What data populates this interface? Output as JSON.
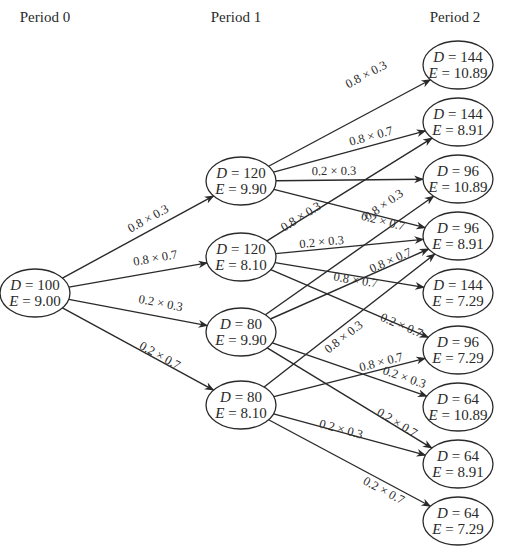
{
  "periods": [
    {
      "label": "Period 0",
      "x": 45,
      "y": 22
    },
    {
      "label": "Period 1",
      "x": 236,
      "y": 22
    },
    {
      "label": "Period 2",
      "x": 455,
      "y": 22
    }
  ],
  "node_style": {
    "rx": 35,
    "ry": 24,
    "stroke": "#2a2a2a"
  },
  "nodes": [
    {
      "id": "p0",
      "period": 0,
      "D": "100",
      "E": "9.00",
      "x": 35,
      "y": 293
    },
    {
      "id": "p1a",
      "period": 1,
      "D": "120",
      "E": "9.90",
      "x": 241,
      "y": 181
    },
    {
      "id": "p1b",
      "period": 1,
      "D": "120",
      "E": "8.10",
      "x": 241,
      "y": 257
    },
    {
      "id": "p1c",
      "period": 1,
      "D": "80",
      "E": "9.90",
      "x": 241,
      "y": 332
    },
    {
      "id": "p1d",
      "period": 1,
      "D": "80",
      "E": "8.10",
      "x": 241,
      "y": 405
    },
    {
      "id": "p2_1",
      "period": 2,
      "D": "144",
      "E": "10.89",
      "x": 458,
      "y": 65
    },
    {
      "id": "p2_2",
      "period": 2,
      "D": "144",
      "E": "8.91",
      "x": 458,
      "y": 122
    },
    {
      "id": "p2_3",
      "period": 2,
      "D": "96",
      "E": "10.89",
      "x": 458,
      "y": 179
    },
    {
      "id": "p2_4",
      "period": 2,
      "D": "96",
      "E": "8.91",
      "x": 458,
      "y": 236
    },
    {
      "id": "p2_5",
      "period": 2,
      "D": "144",
      "E": "7.29",
      "x": 458,
      "y": 293
    },
    {
      "id": "p2_6",
      "period": 2,
      "D": "96",
      "E": "7.29",
      "x": 458,
      "y": 350
    },
    {
      "id": "p2_7",
      "period": 2,
      "D": "64",
      "E": "10.89",
      "x": 458,
      "y": 407
    },
    {
      "id": "p2_8",
      "period": 2,
      "D": "64",
      "E": "8.91",
      "x": 458,
      "y": 464
    },
    {
      "id": "p2_9",
      "period": 2,
      "D": "64",
      "E": "7.29",
      "x": 458,
      "y": 521
    }
  ],
  "edges": [
    {
      "from": "p0",
      "to": "p1a",
      "label": "0.8 × 0.3",
      "lx": 150,
      "ly": 222
    },
    {
      "from": "p0",
      "to": "p1b",
      "label": "0.8 × 0.7",
      "lx": 156,
      "ly": 262
    },
    {
      "from": "p0",
      "to": "p1c",
      "label": "0.2 × 0.3",
      "lx": 160,
      "ly": 307
    },
    {
      "from": "p0",
      "to": "p1d",
      "label": "0.2 × 0.7",
      "lx": 158,
      "ly": 359
    },
    {
      "from": "p1a",
      "to": "p2_1",
      "label": "0.8 × 0.3",
      "lx": 368,
      "ly": 78
    },
    {
      "from": "p1a",
      "to": "p2_2",
      "label": "0.8 × 0.7",
      "lx": 372,
      "ly": 140
    },
    {
      "from": "p1a",
      "to": "p2_3",
      "label": "0.2 × 0.3",
      "lx": 334,
      "ly": 175
    },
    {
      "from": "p1a",
      "to": "p2_4",
      "label": "0.2 × 0.7",
      "lx": 382,
      "ly": 225
    },
    {
      "from": "p1b",
      "to": "p2_2",
      "label": "0.8 × 0.3",
      "lx": 303,
      "ly": 220
    },
    {
      "from": "p1b",
      "to": "p2_4",
      "label": "0.2 × 0.3",
      "lx": 322,
      "ly": 246
    },
    {
      "from": "p1b",
      "to": "p2_5",
      "label": "0.8 × 0.7",
      "lx": 355,
      "ly": 284
    },
    {
      "from": "p1b",
      "to": "p2_6",
      "label": "0.2 × 0.7",
      "lx": 400,
      "ly": 329
    },
    {
      "from": "p1c",
      "to": "p2_3",
      "label": "0.8 × 0.3",
      "lx": 386,
      "ly": 208
    },
    {
      "from": "p1c",
      "to": "p2_4",
      "label": "0.8 × 0.7",
      "lx": 392,
      "ly": 264
    },
    {
      "from": "p1c",
      "to": "p2_7",
      "label": "0.2 × 0.3",
      "lx": 403,
      "ly": 381
    },
    {
      "from": "p1c",
      "to": "p2_8",
      "label": "0.2 × 0.7",
      "lx": 395,
      "ly": 426
    },
    {
      "from": "p1d",
      "to": "p2_4",
      "label": "0.8 × 0.3",
      "lx": 346,
      "ly": 340
    },
    {
      "from": "p1d",
      "to": "p2_6",
      "label": "0.8 × 0.7",
      "lx": 382,
      "ly": 366
    },
    {
      "from": "p1d",
      "to": "p2_8",
      "label": "0.2 × 0.3",
      "lx": 340,
      "ly": 433
    },
    {
      "from": "p1d",
      "to": "p2_9",
      "label": "0.2 × 0.7",
      "lx": 382,
      "ly": 494
    }
  ]
}
